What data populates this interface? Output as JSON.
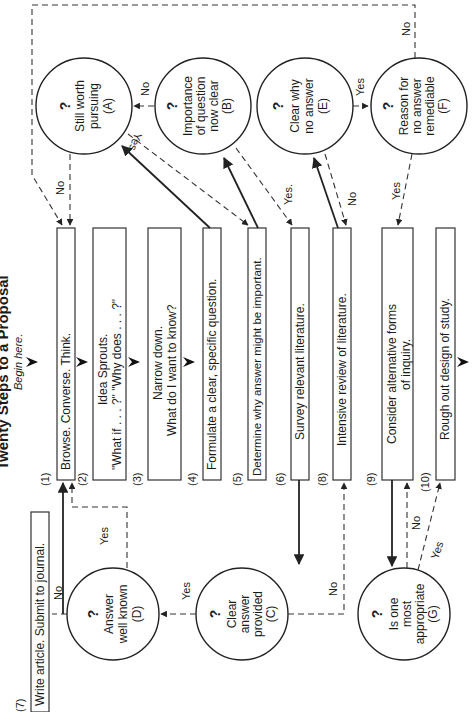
{
  "title": "Twenty Steps to a Proposal",
  "start_label": "Begin here.",
  "steps": [
    {
      "num": "(1)",
      "lines": [
        "Browse. Converse. Think."
      ]
    },
    {
      "num": "(2)",
      "lines": [
        "Idea Sprouts.",
        "\"What if . . . ?\"   \"Why does . . . ?\""
      ]
    },
    {
      "num": "(3)",
      "lines": [
        "Narrow down.",
        "What do I want to know?"
      ]
    },
    {
      "num": "(4)",
      "lines": [
        "Formulate a clear, specific question."
      ]
    },
    {
      "num": "(5)",
      "lines": [
        "Determine why answer might be important."
      ]
    },
    {
      "num": "(6)",
      "lines": [
        "Survey relevant literature."
      ]
    },
    {
      "num": "(8)",
      "lines": [
        "Intensive review of literature."
      ]
    },
    {
      "num": "(9)",
      "lines": [
        "Consider alternative forms",
        "of inquiry."
      ]
    },
    {
      "num": "(10)",
      "lines": [
        "Rough out design of study."
      ]
    },
    {
      "num": "(7)",
      "lines": [
        "Write article. Submit to journal."
      ]
    }
  ],
  "decisions": [
    {
      "id": "A",
      "mark": "?",
      "lines": [
        "Still worth",
        "pursuing",
        "(A)"
      ]
    },
    {
      "id": "B",
      "mark": "?",
      "lines": [
        "Importance",
        "of question",
        "now clear",
        "(B)"
      ]
    },
    {
      "id": "E",
      "mark": "?",
      "lines": [
        "Clear why",
        "no answer",
        "(E)"
      ]
    },
    {
      "id": "F",
      "mark": "?",
      "lines": [
        "Reason for",
        "no answer",
        "remediable",
        "(F)"
      ]
    },
    {
      "id": "D",
      "mark": "?",
      "lines": [
        "Answer",
        "well known",
        "(D)"
      ]
    },
    {
      "id": "C",
      "mark": "?",
      "lines": [
        "Clear",
        "answer",
        "provided",
        "(C)"
      ]
    },
    {
      "id": "G",
      "mark": "?",
      "lines": [
        "Is one",
        "most",
        "appropriate",
        "(G)"
      ]
    }
  ],
  "edge_labels": {
    "a_no": "No",
    "b_no": "No",
    "b_yes": "Yes",
    "f_no": "No",
    "e_yes": "Yes",
    "s5_yes": "Yes.",
    "e_no": "No",
    "f_yes": "Yes",
    "d_no": "No",
    "d_yes": "Yes",
    "c_yes": "Yes",
    "c_no": "No",
    "g_no": "No",
    "g_yes": "Yes"
  }
}
